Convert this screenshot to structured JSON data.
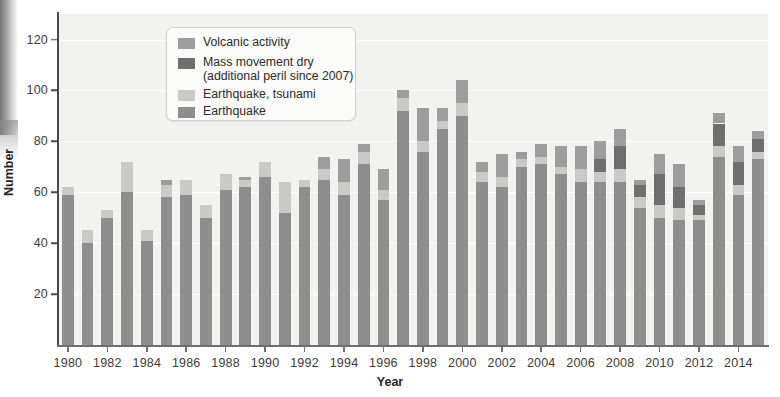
{
  "chart_data": {
    "type": "bar",
    "subtype": "stacked-bar",
    "title": "",
    "xlabel": "Year",
    "ylabel": "Number",
    "ylim": [
      0,
      130
    ],
    "yticks": [
      20,
      40,
      60,
      80,
      100,
      120
    ],
    "xlim": [
      1979.5,
      2015.5
    ],
    "xticks": [
      1980,
      1982,
      1984,
      1986,
      1988,
      1990,
      1992,
      1994,
      1996,
      1998,
      2000,
      2002,
      2004,
      2006,
      2008,
      2010,
      2012,
      2014
    ],
    "grid": "horizontal-white-on-gray",
    "legend_position": "upper-left-inside",
    "categories": [
      1980,
      1981,
      1982,
      1983,
      1984,
      1985,
      1986,
      1987,
      1988,
      1989,
      1990,
      1991,
      1992,
      1993,
      1994,
      1995,
      1996,
      1997,
      1998,
      1999,
      2000,
      2001,
      2002,
      2003,
      2004,
      2005,
      2006,
      2007,
      2008,
      2009,
      2010,
      2011,
      2012,
      2013,
      2014,
      2015
    ],
    "series": [
      {
        "name": "Earthquake",
        "color": "#8e8e8e",
        "values": [
          59,
          40,
          50,
          60,
          41,
          58,
          59,
          50,
          61,
          62,
          66,
          52,
          62,
          65,
          59,
          71,
          57,
          92,
          76,
          85,
          90,
          64,
          62,
          70,
          71,
          67,
          64,
          64,
          64,
          54,
          50,
          49,
          49,
          74,
          59,
          73
        ]
      },
      {
        "name": "Earthquake, tsunami",
        "color": "#c9c9c7",
        "values": [
          3,
          5,
          3,
          12,
          4,
          5,
          6,
          5,
          6,
          3,
          6,
          12,
          3,
          4,
          5,
          5,
          4,
          5,
          4,
          3,
          5,
          4,
          4,
          3,
          3,
          3,
          5,
          4,
          5,
          4,
          5,
          5,
          2,
          4,
          4,
          3
        ]
      },
      {
        "name": "Mass movement dry (additional peril since 2007)",
        "color": "#6f6f6f",
        "values": [
          0,
          0,
          0,
          0,
          0,
          0,
          0,
          0,
          0,
          0,
          0,
          0,
          0,
          0,
          0,
          0,
          0,
          0,
          0,
          0,
          0,
          0,
          0,
          0,
          0,
          0,
          0,
          5,
          9,
          5,
          12,
          8,
          4,
          9,
          9,
          5
        ]
      },
      {
        "name": "Volcanic activity",
        "color": "#9d9d9d",
        "values": [
          0,
          0,
          0,
          0,
          0,
          2,
          0,
          0,
          0,
          1,
          0,
          0,
          0,
          5,
          9,
          3,
          8,
          3,
          13,
          5,
          9,
          4,
          9,
          3,
          5,
          8,
          9,
          7,
          7,
          2,
          8,
          9,
          2,
          4,
          6,
          3
        ]
      }
    ],
    "totals": [
      62,
      45,
      53,
      72,
      45,
      65,
      65,
      55,
      67,
      66,
      72,
      64,
      65,
      74,
      73,
      79,
      69,
      105,
      93,
      93,
      104,
      72,
      79,
      76,
      79,
      78,
      82,
      80,
      85,
      65,
      75,
      71,
      57,
      91,
      78,
      84
    ]
  },
  "axes": {
    "y_title": "Number",
    "x_title": "Year",
    "y_tick_labels": [
      "20",
      "40",
      "60",
      "80",
      "100",
      "120"
    ],
    "x_tick_labels": [
      "1980",
      "1982",
      "1984",
      "1986",
      "1988",
      "1990",
      "1992",
      "1994",
      "1996",
      "1998",
      "2000",
      "2002",
      "2004",
      "2006",
      "2008",
      "2010",
      "2012",
      "2014"
    ]
  },
  "legend": {
    "items": [
      {
        "label": "Volcanic activity",
        "color": "#9d9d9d"
      },
      {
        "label": "Mass movement dry\n(additional peril since 2007)",
        "color": "#6f6f6f"
      },
      {
        "label": "Earthquake, tsunami",
        "color": "#c9c9c7"
      },
      {
        "label": "Earthquake",
        "color": "#8e8e8e"
      }
    ]
  },
  "style": {
    "plot_background": "#f2f2f0",
    "gridline_color": "#ffffff",
    "axis_color": "#4a4a4a",
    "text_color": "#3b3b3b"
  }
}
